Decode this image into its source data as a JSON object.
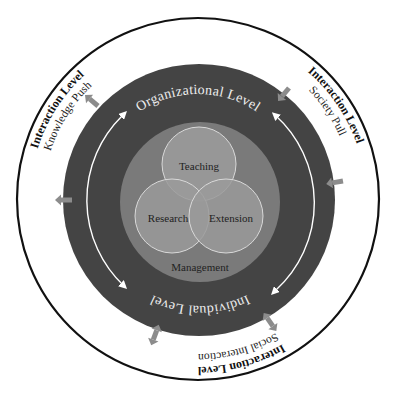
{
  "diagram": {
    "outer_ring": {
      "top_right": {
        "title": "Interaction Level",
        "subtitle": "Society Pull"
      },
      "top_left": {
        "title": "Interaction Level",
        "subtitle": "Knowledge Push"
      },
      "bottom": {
        "title": "Interaction Level",
        "subtitle": "Social Interaction"
      }
    },
    "dark_ring": {
      "top_label": "Organizational Level",
      "bottom_label": "Individual Level"
    },
    "core": {
      "disc_label": "Management",
      "venn": [
        "Teaching",
        "Research",
        "Extension"
      ]
    },
    "colors": {
      "background": "#ffffff",
      "outer_border": "#111111",
      "dark_ring": "#444444",
      "management_disc": "#7a7a7a",
      "venn_fill": "#9a9a9a",
      "venn_stroke": "#d9d9d9",
      "arrow_gray": "#8c8c8c",
      "light_text": "#eeeeee",
      "dark_text": "#222222"
    }
  }
}
